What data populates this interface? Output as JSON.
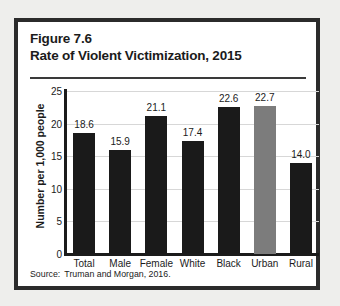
{
  "figure": {
    "number_line": "Figure 7.6",
    "title_line": "Rate of Violent Victimization, 2015",
    "source_label": "Source:",
    "source_text": "Truman and Morgan, 2016."
  },
  "colors": {
    "bar_default": "#1a1a1a",
    "bar_highlight": "#7c7c7c",
    "frame": "#2b2b2b",
    "grid": "#d7d7d7",
    "page_background": "#eeeeec",
    "panel_background": "#ffffff",
    "text": "#1b1b1b"
  },
  "chart_data": {
    "type": "bar",
    "title": "Rate of Violent Victimization, 2015",
    "subtitle": "Figure 7.6",
    "xlabel": "",
    "ylabel": "Number per 1,000 people",
    "categories": [
      "Total",
      "Male",
      "Female",
      "White",
      "Black",
      "Urban",
      "Rural"
    ],
    "values": [
      18.6,
      15.9,
      21.1,
      17.4,
      22.6,
      22.7,
      14.0
    ],
    "value_labels": [
      "18.6",
      "15.9",
      "21.1",
      "17.4",
      "22.6",
      "22.7",
      "14.0"
    ],
    "bar_colors": [
      "#1a1a1a",
      "#1a1a1a",
      "#1a1a1a",
      "#1a1a1a",
      "#1a1a1a",
      "#7c7c7c",
      "#1a1a1a"
    ],
    "highlighted_category": "Urban",
    "ylim": [
      0,
      25
    ],
    "yticks": [
      0,
      5,
      10,
      15,
      20,
      25
    ],
    "ytick_labels": [
      "0",
      "5",
      "10",
      "15",
      "20",
      "25"
    ],
    "grid": true,
    "grid_axis": "y",
    "legend": false,
    "source": "Source: Truman and Morgan, 2016."
  }
}
